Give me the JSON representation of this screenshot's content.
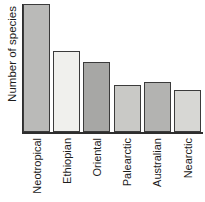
{
  "chart_data": {
    "type": "bar",
    "title": "",
    "xlabel": "",
    "ylabel": "Number of species",
    "categories": [
      "Neotropical",
      "Ethiopian",
      "Oriental",
      "Palearctic",
      "Australian",
      "Nearctic"
    ],
    "values_pct_of_max": [
      100,
      63,
      55,
      37,
      39,
      33
    ],
    "numeric_axis_labels": false,
    "grid": false,
    "legend": false,
    "bar_colors": [
      "#babab8",
      "#f0f0ed",
      "#a7a7a5",
      "#c9c9c6",
      "#b3b3b1",
      "#d7d7d4"
    ],
    "bar_border_color": "#3b3b3b",
    "axis_color": "#2e2e2e",
    "label_color": "#1c1c1c",
    "background": "#ffffff"
  }
}
